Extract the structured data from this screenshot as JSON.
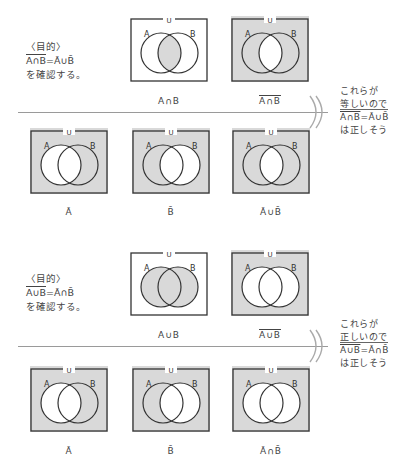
{
  "sections": [
    {
      "purpose_heading": "〈目的〉",
      "purpose_formula": "A∩B = Ā∪B̄",
      "purpose_formula_lhs": "A∩B",
      "purpose_formula_rhs": "=Ā∪B̄",
      "purpose_action": "を確認する。",
      "top_diagrams": [
        {
          "caption": "A∩B",
          "caption_overline": false,
          "shade": "intersection"
        },
        {
          "caption": "A∩B",
          "caption_overline": true,
          "shade": "complement-intersection"
        }
      ],
      "bottom_diagrams": [
        {
          "caption": "Ā",
          "shade": "complement-A"
        },
        {
          "caption": "B̄",
          "shade": "complement-B"
        },
        {
          "caption": "Ā∪B̄",
          "shade": "complement-intersection"
        }
      ],
      "conclusion_lines": [
        "これらが",
        "等しいので",
        "A∩B=Ā∪B̄",
        "は正しそう"
      ],
      "conclusion_formula_lhs": "A∩B",
      "conclusion_formula_rhs": "=Ā∪B̄"
    },
    {
      "purpose_heading": "〈目的〉",
      "purpose_formula": "A∪B = Ā∩B̄",
      "purpose_formula_lhs": "A∪B",
      "purpose_formula_rhs": "=Ā∩B̄",
      "purpose_action": "を確認する。",
      "top_diagrams": [
        {
          "caption": "A∪B",
          "caption_overline": false,
          "shade": "union"
        },
        {
          "caption": "A∪B",
          "caption_overline": true,
          "shade": "complement-union"
        }
      ],
      "bottom_diagrams": [
        {
          "caption": "Ā",
          "shade": "complement-A"
        },
        {
          "caption": "B̄",
          "shade": "complement-B"
        },
        {
          "caption": "Ā∩B̄",
          "shade": "complement-union"
        }
      ],
      "conclusion_lines": [
        "これらが",
        "正しいので",
        "A∪B=Ā∩B̄",
        "は正しそう"
      ],
      "conclusion_formula_lhs": "A∪B",
      "conclusion_formula_rhs": "=Ā∩B̄"
    }
  ],
  "labels": {
    "universe": "U",
    "set_a": "A",
    "set_b": "B"
  },
  "colors": {
    "shade": "#d9d9d9",
    "line": "#333333",
    "rule": "#9a9a9a",
    "background": "#ffffff"
  }
}
